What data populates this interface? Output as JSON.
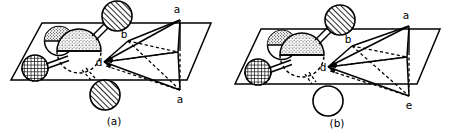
{
  "figure": {
    "type": "line-diagram",
    "background_color": "#ffffff",
    "ink_color": "#000000",
    "panel_count": 2
  },
  "panels": [
    {
      "id": "a",
      "caption": "(a)",
      "vertex_labels": {
        "top": "a",
        "middle": "b",
        "origin": "d",
        "bottom": "a"
      },
      "bottom_sphere_style": "diagonal-hatch",
      "atoms": [
        {
          "name": "axial-top-atom",
          "fill": "diagonal-hatch",
          "label": ""
        },
        {
          "name": "axial-bottom-atom",
          "fill": "diagonal-hatch",
          "label": ""
        },
        {
          "name": "central-atom",
          "fill": "stipple",
          "label": ""
        },
        {
          "name": "upper-left-atom",
          "fill": "stipple",
          "label": ""
        },
        {
          "name": "lower-left-atom",
          "fill": "cross-hatch",
          "label": ""
        }
      ]
    },
    {
      "id": "b",
      "caption": "(b)",
      "vertex_labels": {
        "top": "a",
        "middle": "b",
        "origin": "d",
        "bottom": "e"
      },
      "bottom_sphere_style": "open",
      "atoms": [
        {
          "name": "axial-top-atom",
          "fill": "diagonal-hatch",
          "label": ""
        },
        {
          "name": "axial-bottom-atom",
          "fill": "open",
          "label": ""
        },
        {
          "name": "central-atom",
          "fill": "stipple",
          "label": ""
        },
        {
          "name": "upper-left-atom",
          "fill": "stipple",
          "label": ""
        },
        {
          "name": "lower-left-atom",
          "fill": "cross-hatch",
          "label": ""
        }
      ]
    }
  ]
}
